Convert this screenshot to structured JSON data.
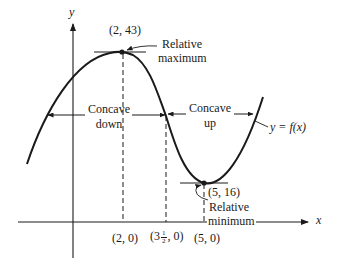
{
  "diagram": {
    "type": "function-graph",
    "axes": {
      "x_label": "x",
      "y_label": "y"
    },
    "curve_label": "y = f(x)",
    "points": {
      "maximum": {
        "label": "(2, 43)",
        "annotation_line1": "Relative",
        "annotation_line2": "maximum"
      },
      "minimum": {
        "label": "(5, 16)",
        "annotation_line1": "Relative",
        "annotation_line2": "minimum"
      }
    },
    "x_ticks": [
      {
        "label": "(2, 0)"
      },
      {
        "label_prefix": "(3",
        "frac_num": "1",
        "frac_den": "2",
        "label_suffix": ", 0)"
      },
      {
        "label": "(5, 0)"
      }
    ],
    "regions": {
      "concave_down": {
        "line1": "Concave",
        "line2": "down"
      },
      "concave_up": {
        "line1": "Concave",
        "line2": "up"
      }
    },
    "colors": {
      "ink": "#1a1a1a",
      "background": "#ffffff"
    }
  }
}
